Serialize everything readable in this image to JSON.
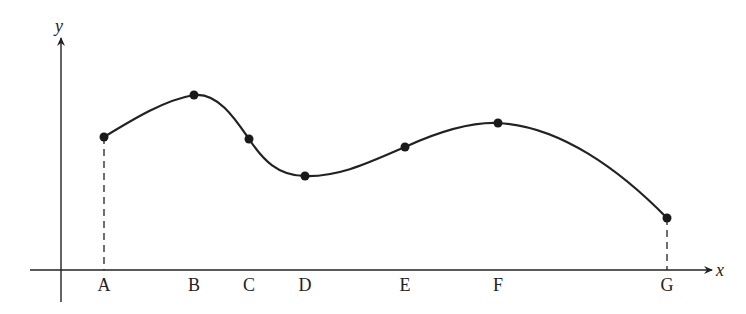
{
  "figure": {
    "axes": {
      "x_label": "x",
      "y_label": "y",
      "origin": [
        61,
        270
      ],
      "x_axis": {
        "x1": 30,
        "x2": 712,
        "y": 270
      },
      "y_axis": {
        "x": 61,
        "y1": 302,
        "y2": 38
      }
    },
    "stroke_color": "#222222",
    "points": [
      {
        "label": "A",
        "x": 104,
        "y": 137,
        "dashed_drop": true
      },
      {
        "label": "B",
        "x": 194,
        "y": 95,
        "dashed_drop": false
      },
      {
        "label": "C",
        "x": 249,
        "y": 139,
        "dashed_drop": false
      },
      {
        "label": "D",
        "x": 305,
        "y": 176,
        "dashed_drop": false
      },
      {
        "label": "E",
        "x": 405,
        "y": 147,
        "dashed_drop": false
      },
      {
        "label": "F",
        "x": 498,
        "y": 123,
        "dashed_drop": false
      },
      {
        "label": "G",
        "x": 667,
        "y": 218,
        "dashed_drop": true
      }
    ],
    "curve_path": "M104,137 C135,118 165,100 194,95 C218,92 236,120 249,139 C263,160 278,176 305,176 C340,177 370,162 405,147 C440,131 470,122 498,123 C560,126 620,170 667,218"
  }
}
